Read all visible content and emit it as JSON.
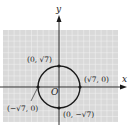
{
  "diagram": {
    "type": "circle-on-coordinate-plane",
    "axes": {
      "x_label": "x",
      "y_label": "y",
      "origin_label": "O"
    },
    "circle": {
      "center": [
        0,
        0
      ],
      "radius": "√7"
    },
    "points": [
      {
        "name": "top",
        "label": "(0, √7)"
      },
      {
        "name": "right",
        "label": "(√7, 0)"
      },
      {
        "name": "left",
        "label": "(−√7, 0)"
      },
      {
        "name": "bottom",
        "label": "(0, −√7)"
      }
    ],
    "colors": {
      "grid_bg": "#d9d9d9",
      "grid_line": "#f2f2f2",
      "ink": "#1a1a1a"
    }
  }
}
